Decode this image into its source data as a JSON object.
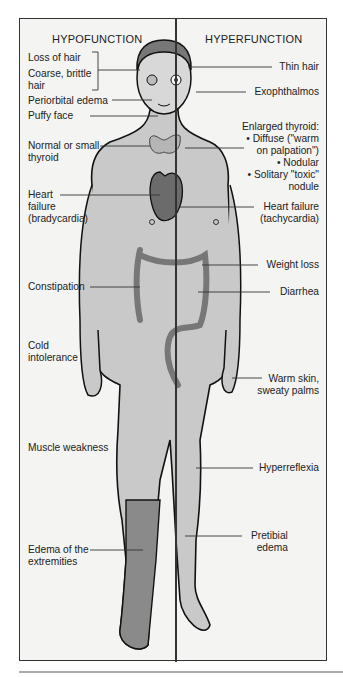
{
  "headings": {
    "left": "HYPOFUNCTION",
    "right": "HYPERFUNCTION"
  },
  "hypofunction_labels": [
    {
      "id": "loss-of-hair",
      "text": "Loss of hair"
    },
    {
      "id": "coarse-hair",
      "text": "Coarse, brittle\nhair"
    },
    {
      "id": "periorbital-edema",
      "text": "Periorbital edema"
    },
    {
      "id": "puffy-face",
      "text": "Puffy face"
    },
    {
      "id": "small-thyroid",
      "text": "Normal or small\nthyroid"
    },
    {
      "id": "heart-failure-brady",
      "text": "Heart\nfailure\n(bradycardia)"
    },
    {
      "id": "constipation",
      "text": "Constipation"
    },
    {
      "id": "cold-intolerance",
      "text": "Cold\nintolerance"
    },
    {
      "id": "muscle-weakness",
      "text": "Muscle weakness"
    },
    {
      "id": "edema-extremities",
      "text": "Edema of the\nextremities"
    }
  ],
  "hyperfunction_labels": [
    {
      "id": "thin-hair",
      "text": "Thin hair"
    },
    {
      "id": "exophthalmos",
      "text": "Exophthalmos"
    },
    {
      "id": "enlarged-thyroid",
      "text": "Enlarged thyroid:\n• Diffuse (\"warm\non palpation\")\n• Nodular\n• Solitary \"toxic\"\nnodule"
    },
    {
      "id": "heart-failure-tachy",
      "text": "Heart failure\n(tachycardia)"
    },
    {
      "id": "weight-loss",
      "text": "Weight loss"
    },
    {
      "id": "diarrhea",
      "text": "Diarrhea"
    },
    {
      "id": "warm-skin",
      "text": "Warm skin,\nsweaty palms"
    },
    {
      "id": "hyperreflexia",
      "text": "Hyperreflexia"
    },
    {
      "id": "pretibial-edema",
      "text": "Pretibial\nedema"
    }
  ],
  "colors": {
    "frame": "#333333",
    "background": "#f4f4f2",
    "body_fill": "#c9c9c9",
    "heart_fill": "#6b6b6b",
    "edema_leg": "#8a8a8a"
  }
}
